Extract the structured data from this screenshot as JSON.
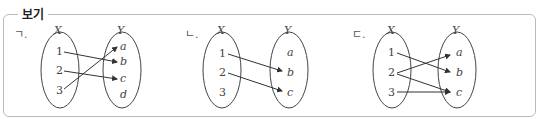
{
  "legend": "보기",
  "diagrams": [
    {
      "label": "ㄱ.",
      "X": [
        "1",
        "2",
        "3"
      ],
      "Y": [
        "a",
        "b",
        "c",
        "d"
      ],
      "set_x": "X",
      "set_y": "Y",
      "arrows": [
        [
          "1",
          "b"
        ],
        [
          "2",
          "c"
        ],
        [
          "3",
          "a"
        ]
      ]
    },
    {
      "label": "ㄴ.",
      "X": [
        "1",
        "2",
        "3"
      ],
      "Y": [
        "a",
        "b",
        "c"
      ],
      "set_x": "X",
      "set_y": "Y",
      "arrows": [
        [
          "1",
          "b"
        ],
        [
          "2",
          "c"
        ]
      ]
    },
    {
      "label": "ㄷ.",
      "X": [
        "1",
        "2",
        "3"
      ],
      "Y": [
        "a",
        "b",
        "c"
      ],
      "set_x": "X",
      "set_y": "Y",
      "arrows": [
        [
          "1",
          "b"
        ],
        [
          "2",
          "a"
        ],
        [
          "2",
          "c"
        ],
        [
          "3",
          "c"
        ]
      ]
    }
  ]
}
